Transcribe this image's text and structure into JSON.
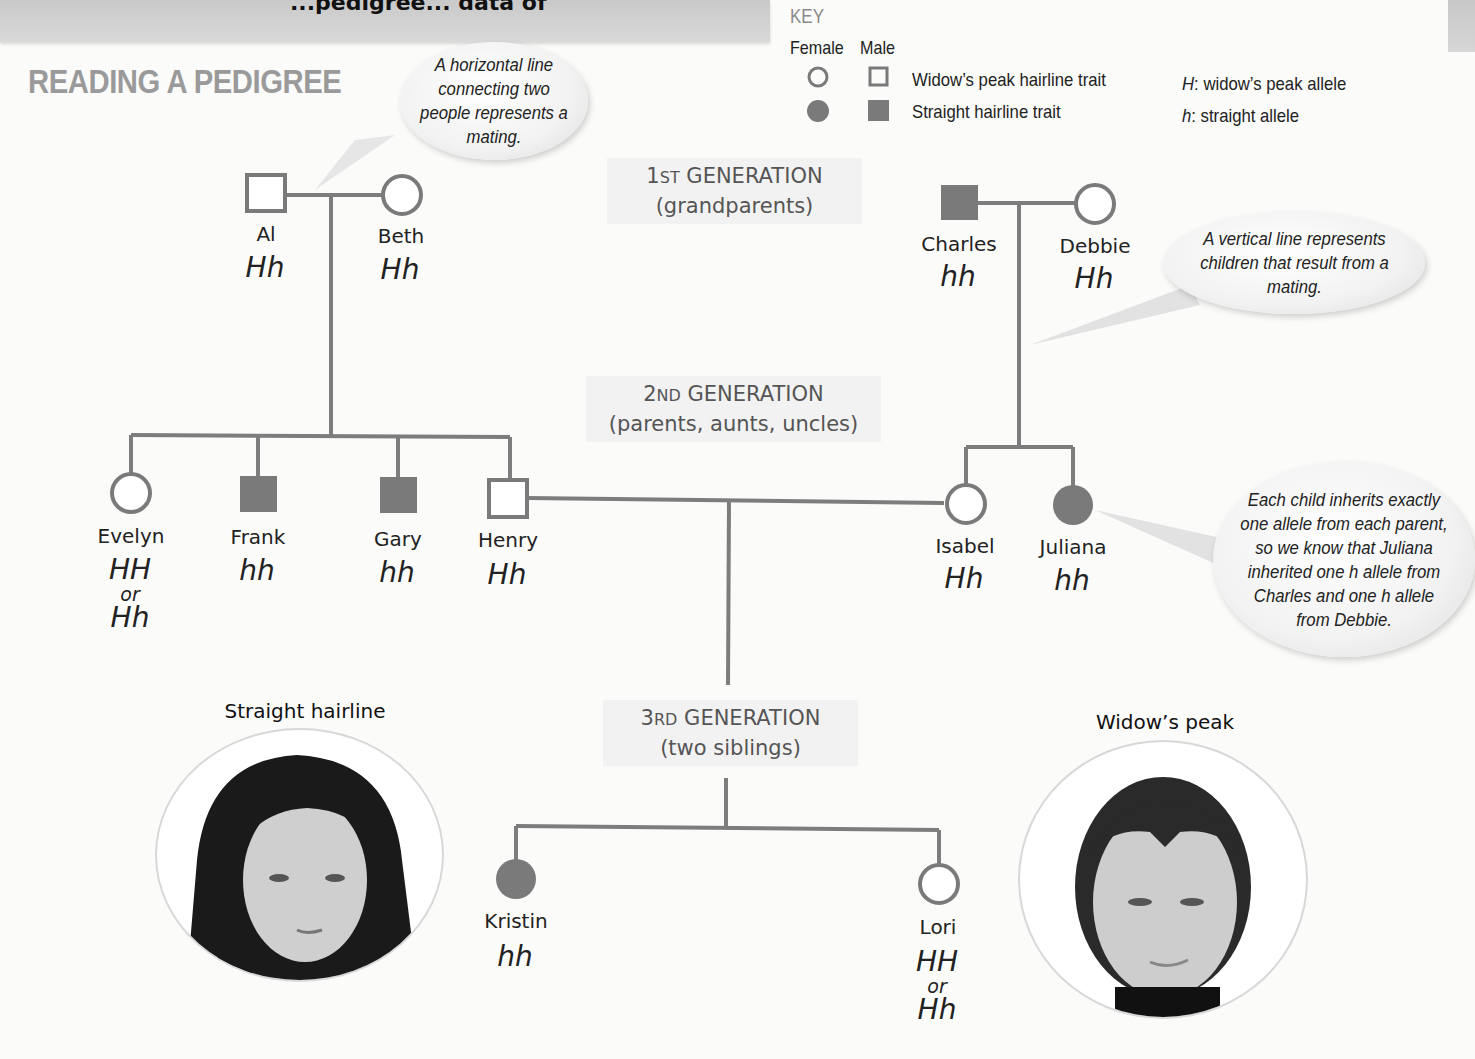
{
  "header": {
    "title": "READING A PEDIGREE",
    "top_band_text": "...pedigree... data of"
  },
  "key": {
    "title": "KEY",
    "female_label": "Female",
    "male_label": "Male",
    "items": [
      {
        "label": "Widow’s peak hairline trait",
        "symbol": "unfilled",
        "allele_letter": "H",
        "allele_text": ":  widow’s peak allele"
      },
      {
        "label": "Straight hairline trait",
        "symbol": "filled",
        "allele_letter": "h",
        "allele_text": ":  straight allele"
      }
    ]
  },
  "callouts": {
    "horizontal": "A horizontal line connecting two people represents a mating.",
    "vertical": "A vertical line represents children that result from a mating.",
    "inherit": "Each child inherits exactly one allele from each parent, so we know that Juliana inherited one h allele from Charles and one h allele from Debbie."
  },
  "generations": [
    {
      "num": "1",
      "suffix": "ST",
      "label": "GENERATION",
      "sub": "(grandparents)"
    },
    {
      "num": "2",
      "suffix": "ND",
      "label": "GENERATION",
      "sub": "(parents, aunts, uncles)"
    },
    {
      "num": "3",
      "suffix": "RD",
      "label": "GENERATION",
      "sub": "(two siblings)"
    }
  ],
  "people": {
    "al": {
      "name": "Al",
      "sex": "male",
      "trait": "widow's peak",
      "genotype": "Hh"
    },
    "beth": {
      "name": "Beth",
      "sex": "female",
      "trait": "widow's peak",
      "genotype": "Hh"
    },
    "charles": {
      "name": "Charles",
      "sex": "male",
      "trait": "straight",
      "genotype": "hh"
    },
    "debbie": {
      "name": "Debbie",
      "sex": "female",
      "trait": "widow's peak",
      "genotype": "Hh"
    },
    "evelyn": {
      "name": "Evelyn",
      "sex": "female",
      "trait": "widow's peak",
      "genotype": "HH",
      "or": "or",
      "genotype_alt": "Hh"
    },
    "frank": {
      "name": "Frank",
      "sex": "male",
      "trait": "straight",
      "genotype": "hh"
    },
    "gary": {
      "name": "Gary",
      "sex": "male",
      "trait": "straight",
      "genotype": "hh"
    },
    "henry": {
      "name": "Henry",
      "sex": "male",
      "trait": "widow's peak",
      "genotype": "Hh"
    },
    "isabel": {
      "name": "Isabel",
      "sex": "female",
      "trait": "widow's peak",
      "genotype": "Hh"
    },
    "juliana": {
      "name": "Juliana",
      "sex": "female",
      "trait": "straight",
      "genotype": "hh"
    },
    "kristin": {
      "name": "Kristin",
      "sex": "female",
      "trait": "straight",
      "genotype": "hh"
    },
    "lori": {
      "name": "Lori",
      "sex": "female",
      "trait": "widow's peak",
      "genotype": "HH",
      "or": "or",
      "genotype_alt": "Hh"
    }
  },
  "photos": {
    "left_label": "Straight hairline",
    "right_label": "Widow’s peak"
  },
  "colors": {
    "symbol_gray": "#7a7a7a",
    "line_gray": "#7d7d7d",
    "title_gray": "#9a9a9a"
  }
}
